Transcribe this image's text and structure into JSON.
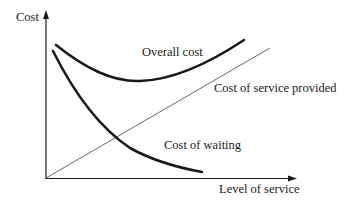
{
  "diagram": {
    "axes": {
      "y_label": "Cost",
      "x_label": "Level of service"
    },
    "curves": [
      {
        "id": "overall-cost",
        "label": "Overall cost",
        "style": "thick",
        "shape": "U-shaped"
      },
      {
        "id": "cost-of-service",
        "label": "Cost of service provided",
        "style": "thin",
        "shape": "linear increasing"
      },
      {
        "id": "cost-of-waiting",
        "label": "Cost of waiting",
        "style": "thick",
        "shape": "decreasing convex"
      }
    ],
    "colors": {
      "ink": "#1a1a1a",
      "thin_line": "#555555",
      "background": "#ffffff"
    }
  }
}
